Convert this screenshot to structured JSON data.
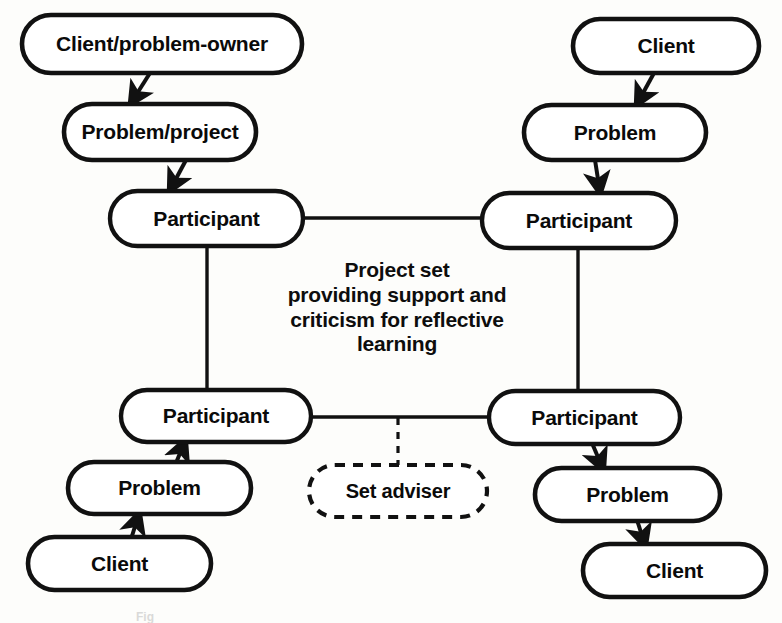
{
  "figure": {
    "type": "network-diagram",
    "background_color": "#fdfdfb",
    "stroke_color": "#111111",
    "caption_fragment": "Fig"
  },
  "nodes": [
    {
      "id": "client-problem-owner-tl",
      "label": "Client/problem-owner",
      "shape": "rounded-capsule",
      "style": "solid",
      "x": 22,
      "y": 15,
      "w": 280,
      "h": 58,
      "font_size": 21
    },
    {
      "id": "problem-project-tl",
      "label": "Problem/project",
      "shape": "rounded-capsule",
      "style": "solid",
      "x": 64,
      "y": 104,
      "w": 192,
      "h": 56,
      "font_size": 21
    },
    {
      "id": "participant-tl",
      "label": "Participant",
      "shape": "rounded-capsule",
      "style": "solid",
      "x": 110,
      "y": 191,
      "w": 193,
      "h": 55,
      "font_size": 21
    },
    {
      "id": "client-tr",
      "label": "Client",
      "shape": "rounded-capsule",
      "style": "solid",
      "x": 573,
      "y": 19,
      "w": 186,
      "h": 54,
      "font_size": 21
    },
    {
      "id": "problem-tr",
      "label": "Problem",
      "shape": "rounded-capsule",
      "style": "solid",
      "x": 524,
      "y": 105,
      "w": 182,
      "h": 55,
      "font_size": 21
    },
    {
      "id": "participant-tr",
      "label": "Participant",
      "shape": "rounded-capsule",
      "style": "solid",
      "x": 482,
      "y": 193,
      "w": 194,
      "h": 55,
      "font_size": 21
    },
    {
      "id": "participant-bl",
      "label": "Participant",
      "shape": "rounded-capsule",
      "style": "solid",
      "x": 121,
      "y": 390,
      "w": 190,
      "h": 52,
      "font_size": 21
    },
    {
      "id": "problem-bl",
      "label": "Problem",
      "shape": "rounded-capsule",
      "style": "solid",
      "x": 68,
      "y": 462,
      "w": 183,
      "h": 52,
      "font_size": 21
    },
    {
      "id": "client-bl",
      "label": "Client",
      "shape": "rounded-capsule",
      "style": "solid",
      "x": 28,
      "y": 537,
      "w": 183,
      "h": 53,
      "font_size": 21
    },
    {
      "id": "participant-br",
      "label": "Participant",
      "shape": "rounded-capsule",
      "style": "solid",
      "x": 489,
      "y": 391,
      "w": 191,
      "h": 53,
      "font_size": 21
    },
    {
      "id": "problem-br",
      "label": "Problem",
      "shape": "rounded-capsule",
      "style": "solid",
      "x": 535,
      "y": 468,
      "w": 185,
      "h": 53,
      "font_size": 21
    },
    {
      "id": "client-br",
      "label": "Client",
      "shape": "rounded-capsule",
      "style": "solid",
      "x": 583,
      "y": 544,
      "w": 183,
      "h": 53,
      "font_size": 21
    },
    {
      "id": "set-adviser",
      "label": "Set adviser",
      "shape": "rounded-capsule",
      "style": "dashed",
      "x": 309,
      "y": 465,
      "w": 178,
      "h": 52,
      "font_size": 20
    }
  ],
  "edges": [
    {
      "id": "e1",
      "from": "client-problem-owner-tl",
      "to": "problem-project-tl",
      "kind": "arrow",
      "style": "solid"
    },
    {
      "id": "e2",
      "from": "problem-project-tl",
      "to": "participant-tl",
      "kind": "arrow",
      "style": "solid"
    },
    {
      "id": "e3",
      "from": "client-tr",
      "to": "problem-tr",
      "kind": "arrow",
      "style": "solid"
    },
    {
      "id": "e4",
      "from": "problem-tr",
      "to": "participant-tr",
      "kind": "arrow",
      "style": "solid"
    },
    {
      "id": "e5",
      "from": "participant-tl",
      "to": "participant-tr",
      "kind": "line",
      "style": "solid"
    },
    {
      "id": "e6",
      "from": "participant-tl",
      "to": "participant-bl",
      "kind": "line",
      "style": "solid"
    },
    {
      "id": "e7",
      "from": "participant-tr",
      "to": "participant-br",
      "kind": "line",
      "style": "solid"
    },
    {
      "id": "e8",
      "from": "participant-bl",
      "to": "participant-br",
      "kind": "line",
      "style": "solid"
    },
    {
      "id": "e9",
      "from": "participant-bl",
      "to": "problem-bl",
      "kind": "arrow",
      "style": "solid"
    },
    {
      "id": "e10",
      "from": "problem-bl",
      "to": "client-bl",
      "kind": "arrow",
      "style": "solid"
    },
    {
      "id": "e11",
      "from": "participant-br",
      "to": "problem-br",
      "kind": "arrow",
      "style": "solid"
    },
    {
      "id": "e12",
      "from": "problem-br",
      "to": "client-br",
      "kind": "arrow",
      "style": "solid"
    },
    {
      "id": "e13",
      "from": "participant-link-bottom",
      "to": "set-adviser",
      "kind": "line",
      "style": "dashed"
    }
  ],
  "annotations": {
    "center_note": {
      "id": "project-set-note",
      "lines": [
        "Project set",
        "providing support and",
        "criticism for reflective",
        "learning"
      ],
      "text": "Project set providing support and criticism for reflective learning",
      "x": 272,
      "y": 258,
      "w": 250,
      "font_size": 21
    }
  }
}
